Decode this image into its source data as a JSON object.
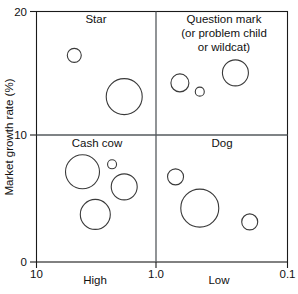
{
  "chart_data": {
    "type": "scatter",
    "title": "",
    "subtitle": "",
    "xlabel": "",
    "ylabel": "Market growth rate (%)",
    "xscale": "log-reversed",
    "xlim": [
      10,
      0.1
    ],
    "ylim": [
      0,
      20
    ],
    "grid": false,
    "legend": "none",
    "x_tick_labels": [
      "10",
      "1.0",
      "0.1"
    ],
    "x_tick_values": [
      10,
      1.0,
      0.1
    ],
    "y_tick_labels": [
      "0",
      "10",
      "20"
    ],
    "y_tick_values": [
      0,
      10,
      20
    ],
    "x_category_labels": [
      {
        "label": "High",
        "at_x": 3.2
      },
      {
        "label": "Low",
        "at_x": 0.32
      }
    ],
    "divider_x": 1.0,
    "divider_y": 10,
    "quadrants": [
      {
        "name": "star",
        "label_lines": [
          "Star"
        ],
        "position": "top-left"
      },
      {
        "name": "question-mark",
        "label_lines": [
          "Question mark",
          "(or problem child",
          "or wildcat)"
        ],
        "position": "top-right"
      },
      {
        "name": "cash-cow",
        "label_lines": [
          "Cash cow"
        ],
        "position": "bottom-left"
      },
      {
        "name": "dog",
        "label_lines": [
          "Dog"
        ],
        "position": "bottom-right"
      }
    ],
    "series": [
      {
        "name": "Star",
        "quadrant": "star",
        "points": [
          {
            "x": 5.0,
            "y": 16.5,
            "size": 7
          },
          {
            "x": 2.0,
            "y": 13.2,
            "size": 18
          }
        ]
      },
      {
        "name": "Question mark",
        "quadrant": "question-mark",
        "points": [
          {
            "x": 0.72,
            "y": 14.3,
            "size": 9
          },
          {
            "x": 0.5,
            "y": 13.6,
            "size": 4.5
          },
          {
            "x": 0.26,
            "y": 15.1,
            "size": 13
          }
        ]
      },
      {
        "name": "Cash cow",
        "quadrant": "cash-cow",
        "points": [
          {
            "x": 4.3,
            "y": 7.2,
            "size": 17
          },
          {
            "x": 2.5,
            "y": 7.8,
            "size": 4.5
          },
          {
            "x": 2.0,
            "y": 6.0,
            "size": 13
          },
          {
            "x": 3.4,
            "y": 3.8,
            "size": 15
          }
        ]
      },
      {
        "name": "Dog",
        "quadrant": "dog",
        "points": [
          {
            "x": 0.78,
            "y": 6.8,
            "size": 8
          },
          {
            "x": 0.5,
            "y": 4.3,
            "size": 19
          },
          {
            "x": 0.2,
            "y": 3.2,
            "size": 8
          }
        ]
      }
    ]
  },
  "axes": {
    "y_title": "Market growth rate (%)",
    "y_ticks": [
      "20",
      "10",
      "0"
    ],
    "x_ticks": [
      "10",
      "1.0",
      "0.1"
    ],
    "x_categories": [
      "High",
      "Low"
    ]
  },
  "quadrant_text": {
    "star": "Star",
    "question_line1": "Question mark",
    "question_line2": "(or problem child",
    "question_line3": "or wildcat)",
    "cash_cow": "Cash cow",
    "dog": "Dog"
  },
  "colors": {
    "frame": "#1a1a1a",
    "divider": "#555a5e",
    "bubble_stroke": "#3a3a3a",
    "text": "#111111",
    "background": "#ffffff"
  }
}
